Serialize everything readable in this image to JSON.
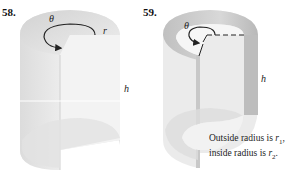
{
  "figures": [
    {
      "number": "58.",
      "labels": {
        "angle": "θ",
        "radius": "r",
        "height": "h"
      }
    },
    {
      "number": "59.",
      "labels": {
        "angle": "θ",
        "height": "h"
      },
      "note": {
        "line1_prefix": "Outside radius is ",
        "line1_var": "r",
        "line1_sub": "1",
        "line1_suffix": ",",
        "line2_prefix": "inside radius is ",
        "line2_var": "r",
        "line2_sub": "2",
        "line2_suffix": "."
      }
    }
  ]
}
